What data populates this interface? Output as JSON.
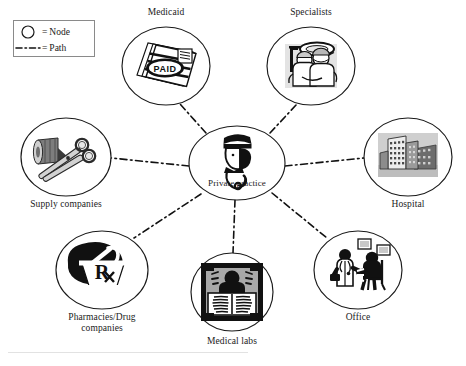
{
  "diagram": {
    "stroke_color": "#111111",
    "node_outline_color": "#1a1a1a",
    "background": "#ffffff"
  },
  "legend": {
    "box_label": "legend",
    "rows": [
      {
        "glyph": "circle-outline",
        "equals": "=",
        "label": "Node"
      },
      {
        "glyph": "dash-dot-line",
        "equals": "=",
        "label": "Path"
      }
    ]
  },
  "center_node": {
    "id": "private-practice",
    "label": "Private practice",
    "label_position": "inside",
    "icon": "doctor-with-stethoscope-icon",
    "cx": 237,
    "cy": 163,
    "rx": 48,
    "ry": 37
  },
  "nodes": [
    {
      "id": "medicaid",
      "label": "Medicaid",
      "label_position": "above",
      "icon": "paid-invoice-icon",
      "cx": 166,
      "cy": 66,
      "rx": 44,
      "ry": 39
    },
    {
      "id": "specialists",
      "label": "Specialists",
      "label_position": "above",
      "icon": "surgeons-operating-icon",
      "cx": 311,
      "cy": 66,
      "rx": 44,
      "ry": 39
    },
    {
      "id": "hospital",
      "label": "Hospital",
      "label_position": "below",
      "icon": "hospital-building-icon",
      "cx": 408,
      "cy": 157,
      "rx": 44,
      "ry": 39
    },
    {
      "id": "office",
      "label": "Office",
      "label_position": "below",
      "icon": "doctor-examining-patient-icon",
      "cx": 358,
      "cy": 270,
      "rx": 44,
      "ry": 39
    },
    {
      "id": "medical-labs",
      "label": "Medical labs",
      "label_position": "below",
      "icon": "xray-chest-icon",
      "cx": 232,
      "cy": 292,
      "rx": 41,
      "ry": 39
    },
    {
      "id": "pharmacies-drug-companies",
      "label": "Pharmacies/Drug\ncompanies",
      "label_position": "below",
      "icon": "mortar-pestle-rx-icon",
      "cx": 102,
      "cy": 270,
      "rx": 46,
      "ry": 39
    },
    {
      "id": "supply-companies",
      "label": "Supply companies",
      "label_position": "below",
      "icon": "forceps-bandage-icon",
      "cx": 66,
      "cy": 157,
      "rx": 45,
      "ry": 39
    }
  ],
  "edges": [
    {
      "id": "edge-center-medicaid",
      "from": "private-practice",
      "to": "medicaid",
      "style": "dash-dot"
    },
    {
      "id": "edge-center-specialists",
      "from": "private-practice",
      "to": "specialists",
      "style": "dash-dot"
    },
    {
      "id": "edge-center-hospital",
      "from": "private-practice",
      "to": "hospital",
      "style": "dash-dot"
    },
    {
      "id": "edge-center-office",
      "from": "private-practice",
      "to": "office",
      "style": "dash-dot"
    },
    {
      "id": "edge-center-medical-labs",
      "from": "private-practice",
      "to": "medical-labs",
      "style": "dash-dot"
    },
    {
      "id": "edge-center-pharmacies",
      "from": "private-practice",
      "to": "pharmacies-drug-companies",
      "style": "dash-dot"
    },
    {
      "id": "edge-center-supply",
      "from": "private-practice",
      "to": "supply-companies",
      "style": "dash-dot"
    }
  ]
}
